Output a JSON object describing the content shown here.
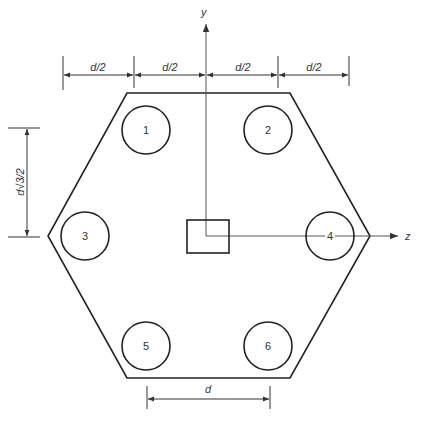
{
  "diagram": {
    "axes": {
      "y_label": "y",
      "z_label": "z"
    },
    "piles": [
      {
        "id": "1",
        "cx": 146,
        "cy": 130
      },
      {
        "id": "2",
        "cx": 268,
        "cy": 130
      },
      {
        "id": "3",
        "cx": 85,
        "cy": 236
      },
      {
        "id": "4",
        "cx": 330,
        "cy": 236
      },
      {
        "id": "5",
        "cx": 146,
        "cy": 346
      },
      {
        "id": "6",
        "cx": 268,
        "cy": 346
      }
    ],
    "pile_radius": 24,
    "dimensions": {
      "top": [
        "d/2",
        "d/2",
        "d/2",
        "d/2"
      ],
      "left": "d√3/2",
      "bottom": "d"
    },
    "colors": {
      "stroke": "#222222",
      "axis": "#555555",
      "text": "#333333",
      "background": "#ffffff"
    }
  }
}
